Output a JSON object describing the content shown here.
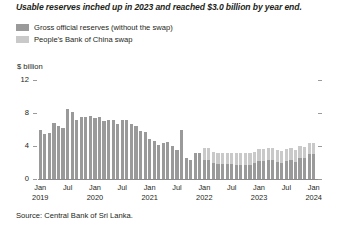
{
  "chart_title": "Usable reserves inched up in 2023 and reached $3.0 billion by year end.",
  "legend": {
    "items": [
      {
        "label": "Gross official reserves (without the swap)",
        "color": "#9a9a9a",
        "name": "legend-gross-official-reserves"
      },
      {
        "label": "People's Bank of China swap",
        "color": "#c9c9c9",
        "name": "legend-pboc-swap"
      }
    ]
  },
  "y_axis": {
    "unit_label": "$ billion",
    "tick_labels": [
      "12",
      "8",
      "4",
      "0"
    ]
  },
  "x_axis": {
    "tick_labels": [
      {
        "month": "Jan",
        "year": "2019"
      },
      {
        "month": "Jul",
        "year": ""
      },
      {
        "month": "Jan",
        "year": "2020"
      },
      {
        "month": "Jul",
        "year": ""
      },
      {
        "month": "Jan",
        "year": "2021"
      },
      {
        "month": "Jul",
        "year": ""
      },
      {
        "month": "Jan",
        "year": "2022"
      },
      {
        "month": "Jul",
        "year": ""
      },
      {
        "month": "Jan",
        "year": "2023"
      },
      {
        "month": "Jul",
        "year": ""
      },
      {
        "month": "Jan",
        "year": "2024"
      }
    ]
  },
  "source": "Source: Central Bank of Sri Lanka.",
  "chart_data": {
    "type": "bar",
    "stacked": true,
    "title": "Usable reserves inched up in 2023 and reached $3.0 billion by year end.",
    "subtitle": "",
    "xlabel": "",
    "ylabel": "$ billion",
    "ylim": [
      0,
      12
    ],
    "yticks": [
      0,
      4,
      8,
      12
    ],
    "grid": false,
    "legend_position": "top-left",
    "categories": [
      "Jan 2019",
      "Feb 2019",
      "Mar 2019",
      "Apr 2019",
      "May 2019",
      "Jun 2019",
      "Jul 2019",
      "Aug 2019",
      "Sep 2019",
      "Oct 2019",
      "Nov 2019",
      "Dec 2019",
      "Jan 2020",
      "Feb 2020",
      "Mar 2020",
      "Apr 2020",
      "May 2020",
      "Jun 2020",
      "Jul 2020",
      "Aug 2020",
      "Sep 2020",
      "Oct 2020",
      "Nov 2020",
      "Dec 2020",
      "Jan 2021",
      "Feb 2021",
      "Mar 2021",
      "Apr 2021",
      "May 2021",
      "Jun 2021",
      "Jul 2021",
      "Aug 2021",
      "Sep 2021",
      "Oct 2021",
      "Nov 2021",
      "Dec 2021",
      "Jan 2022",
      "Feb 2022",
      "Mar 2022",
      "Apr 2022",
      "May 2022",
      "Jun 2022",
      "Jul 2022",
      "Aug 2022",
      "Sep 2022",
      "Oct 2022",
      "Nov 2022",
      "Dec 2022",
      "Jan 2023",
      "Feb 2023",
      "Mar 2023",
      "Apr 2023",
      "May 2023",
      "Jun 2023",
      "Jul 2023",
      "Aug 2023",
      "Sep 2023",
      "Oct 2023",
      "Nov 2023",
      "Dec 2023",
      "Jan 2024"
    ],
    "series": [
      {
        "name": "Gross official reserves (without the swap)",
        "color": "#9a9a9a",
        "values": [
          6.0,
          5.4,
          5.6,
          6.8,
          6.4,
          6.2,
          8.5,
          8.1,
          7.1,
          7.5,
          7.5,
          7.6,
          7.4,
          7.5,
          7.0,
          7.2,
          7.2,
          6.7,
          7.1,
          7.2,
          6.7,
          6.4,
          5.8,
          5.7,
          4.8,
          4.6,
          4.1,
          4.4,
          4.5,
          4.0,
          3.5,
          6.0,
          2.6,
          2.3,
          3.1,
          3.1,
          2.3,
          2.3,
          1.9,
          1.8,
          1.8,
          1.8,
          1.8,
          1.7,
          1.7,
          1.7,
          1.7,
          1.9,
          2.2,
          2.2,
          2.3,
          2.3,
          2.1,
          2.0,
          2.2,
          2.3,
          2.1,
          2.6,
          2.5,
          3.0,
          3.0
        ]
      },
      {
        "name": "People's Bank of China swap",
        "color": "#c9c9c9",
        "values": [
          0,
          0,
          0,
          0,
          0,
          0,
          0,
          0,
          0,
          0,
          0,
          0,
          0,
          0,
          0,
          0,
          0,
          0,
          0,
          0,
          0,
          0,
          0,
          0,
          0,
          0,
          0,
          0,
          0,
          0,
          0,
          0,
          0,
          0,
          0,
          0,
          1.4,
          1.4,
          1.4,
          1.4,
          1.4,
          1.4,
          1.4,
          1.4,
          1.4,
          1.4,
          1.4,
          1.4,
          1.4,
          1.4,
          1.4,
          1.4,
          1.4,
          1.4,
          1.4,
          1.4,
          1.4,
          1.4,
          1.4,
          1.4,
          1.4
        ]
      }
    ]
  }
}
